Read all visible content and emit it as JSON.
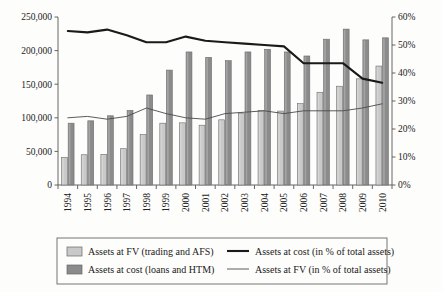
{
  "chart_data": {
    "type": "bar",
    "title": "",
    "subtitle": "",
    "xlabel": "",
    "ylabel": "",
    "y2label": "",
    "grid": false,
    "legend_position": "bottom",
    "categories": [
      "1994",
      "1995",
      "1996",
      "1997",
      "1998",
      "1999",
      "2000",
      "2001",
      "2002",
      "2003",
      "2004",
      "2005",
      "2006",
      "2007",
      "2008",
      "2009",
      "2010"
    ],
    "left_axis": {
      "min": 0,
      "max": 250000,
      "step": 50000,
      "ticks": [
        "0",
        "50,000",
        "100,000",
        "150,000",
        "200,000",
        "250,000"
      ],
      "tick_values": [
        0,
        50000,
        100000,
        150000,
        200000,
        250000
      ]
    },
    "right_axis": {
      "min": 0,
      "max": 60,
      "step": 10,
      "ticks": [
        "0%",
        "10%",
        "20%",
        "30%",
        "40%",
        "50%",
        "60%"
      ],
      "tick_values": [
        0,
        10,
        20,
        30,
        40,
        50,
        60
      ]
    },
    "series": [
      {
        "name": "Assets at FV (trading and AFS)",
        "type": "bar",
        "axis": "left",
        "color": "#c9c9c9",
        "values": [
          41000,
          45000,
          45500,
          54000,
          75000,
          92000,
          92500,
          89000,
          97000,
          107000,
          111000,
          110000,
          121000,
          138000,
          147000,
          158000,
          177000
        ]
      },
      {
        "name": "Assets at cost (loans and HTM)",
        "type": "bar",
        "axis": "left",
        "color": "#8b8b8b",
        "values": [
          92000,
          95500,
          103000,
          111000,
          134000,
          171000,
          198000,
          190000,
          185000,
          198000,
          202000,
          198000,
          192000,
          217000,
          232000,
          216000,
          219000
        ]
      },
      {
        "name": "Assets at cost (in % of total assets)",
        "type": "line",
        "axis": "right",
        "color": "#1a1a1a",
        "width": 2.1,
        "values": [
          55.0,
          54.5,
          55.5,
          53.5,
          51.0,
          51.0,
          53.0,
          51.5,
          51.0,
          50.5,
          50.0,
          49.5,
          43.5,
          43.5,
          43.5,
          38.0,
          36.5
        ]
      },
      {
        "name": "Assets at FV (in % of total assets)",
        "type": "line",
        "axis": "right",
        "color": "#4a4a4a",
        "width": 0.9,
        "values": [
          24.0,
          24.5,
          23.5,
          24.5,
          27.5,
          25.5,
          24.0,
          23.5,
          25.5,
          26.0,
          26.5,
          25.5,
          26.5,
          26.5,
          26.5,
          27.5,
          29.0
        ]
      }
    ],
    "legend": [
      {
        "label": "Assets at FV (trading and AFS)",
        "marker": "swatch",
        "color": "#c9c9c9"
      },
      {
        "label": "Assets at cost (loans and HTM)",
        "marker": "swatch",
        "color": "#8b8b8b"
      },
      {
        "label": "Assets at cost (in % of total assets)",
        "marker": "thick-line",
        "color": "#1a1a1a"
      },
      {
        "label": "Assets at FV (in % of total assets)",
        "marker": "thin-line",
        "color": "#4a4a4a"
      }
    ]
  }
}
